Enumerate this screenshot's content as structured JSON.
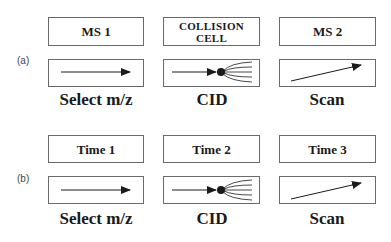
{
  "rows": [
    {
      "tag": "(a)",
      "stages": [
        {
          "header": "MS 1",
          "icon": "straight-arrow-icon",
          "caption": "Select m/z"
        },
        {
          "header_line1": "COLLISION",
          "header_line2": "CELL",
          "icon": "fragmentation-icon",
          "caption": "CID"
        },
        {
          "header": "MS 2",
          "icon": "scan-arrow-icon",
          "caption": "Scan"
        }
      ]
    },
    {
      "tag": "(b)",
      "stages": [
        {
          "header": "Time 1",
          "icon": "straight-arrow-icon",
          "caption": "Select m/z"
        },
        {
          "header": "Time 2",
          "icon": "fragmentation-icon",
          "caption": "CID"
        },
        {
          "header": "Time 3",
          "icon": "scan-arrow-icon",
          "caption": "Scan"
        }
      ]
    }
  ],
  "colors": {
    "line": "#1a1a1a",
    "border": "#6a6a6a"
  }
}
